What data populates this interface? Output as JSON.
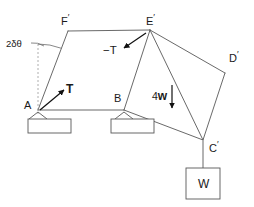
{
  "figure": {
    "type": "statics-free-body-diagram",
    "background_color": "#ffffff",
    "line_color": "#4d4d4d",
    "text_color": "#1a1a1a",
    "width": 254,
    "height": 207
  },
  "vertices": [
    {
      "name": "A",
      "label_base": "A",
      "prime": "",
      "x": 38,
      "y": 110,
      "label_x": 24,
      "label_y": 100
    },
    {
      "name": "B",
      "label_base": "B",
      "prime": "",
      "x": 124,
      "y": 110,
      "label_x": 114,
      "label_y": 93
    },
    {
      "name": "Cp",
      "label_base": "C",
      "prime": "′",
      "x": 203,
      "y": 140,
      "label_x": 209,
      "label_y": 140
    },
    {
      "name": "Dp",
      "label_base": "D",
      "prime": "′",
      "x": 225,
      "y": 73,
      "label_x": 229,
      "label_y": 50
    },
    {
      "name": "Ep",
      "label_base": "E",
      "prime": "′",
      "x": 150,
      "y": 30,
      "label_x": 146,
      "label_y": 13
    },
    {
      "name": "Fp",
      "label_base": "F",
      "prime": "′",
      "x": 68,
      "y": 31,
      "label_x": 61,
      "label_y": 13
    }
  ],
  "members": [
    {
      "name": "A-Fp",
      "from": "A",
      "to": "Fp"
    },
    {
      "name": "Fp-Ep",
      "from": "Fp",
      "to": "Ep"
    },
    {
      "name": "A-B",
      "from": "A",
      "to": "B"
    },
    {
      "name": "B-Cp",
      "from": "B",
      "to": "Cp"
    },
    {
      "name": "B-Ep",
      "from": "B",
      "to": "Ep"
    },
    {
      "name": "Ep-Cp",
      "from": "Ep",
      "to": "Cp"
    },
    {
      "name": "Ep-Dp",
      "from": "Ep",
      "to": "Dp"
    },
    {
      "name": "Dp-Cp",
      "from": "Dp",
      "to": "Cp"
    }
  ],
  "angle_annotation": {
    "label": "2δθ",
    "label_x": 6,
    "label_y": 39,
    "leader_from": {
      "x": 31,
      "y": 43
    },
    "leader_to": {
      "x": 44,
      "y": 46
    },
    "vertical_dashed_from": {
      "x": 38,
      "y": 44
    },
    "vertical_dashed_to": {
      "x": 38,
      "y": 114
    },
    "arc_center": {
      "x": 38,
      "y": 110
    },
    "arc_radius": 66
  },
  "forces": [
    {
      "name": "tension-T-at-A",
      "label": "T",
      "label_x": 66,
      "label_y": 83,
      "bold": true,
      "tail": {
        "x": 40,
        "y": 110
      },
      "head": {
        "x": 64,
        "y": 90
      }
    },
    {
      "name": "reaction-minus-T-at-Ep",
      "label": "−T",
      "label_x": 103,
      "label_y": 45,
      "bold": false,
      "tail": {
        "x": 146,
        "y": 33
      },
      "head": {
        "x": 124,
        "y": 48
      }
    },
    {
      "name": "load-4w-at-Ep",
      "label_magnitude": "4",
      "label_symbol": "w",
      "label": "4w",
      "label_x": 152,
      "label_y": 90,
      "bold": true,
      "tail": {
        "x": 172,
        "y": 85
      },
      "head": {
        "x": 172,
        "y": 108
      }
    }
  ],
  "supports": [
    {
      "name": "pin-support-A",
      "apex": {
        "x": 38,
        "y": 112
      },
      "base_rect": {
        "x": 28,
        "y": 119,
        "width": 43,
        "height": 14
      }
    },
    {
      "name": "pin-support-B",
      "apex": {
        "x": 124,
        "y": 112
      },
      "base_rect": {
        "x": 111,
        "y": 119,
        "width": 43,
        "height": 14
      }
    }
  ],
  "hanging_weight": {
    "name": "weight-block",
    "label": "W",
    "cable_from": {
      "x": 203,
      "y": 141
    },
    "cable_to": {
      "x": 203,
      "y": 168
    },
    "box": {
      "x": 186,
      "y": 168,
      "width": 34,
      "height": 31
    },
    "label_x": 203,
    "label_y": 184
  }
}
